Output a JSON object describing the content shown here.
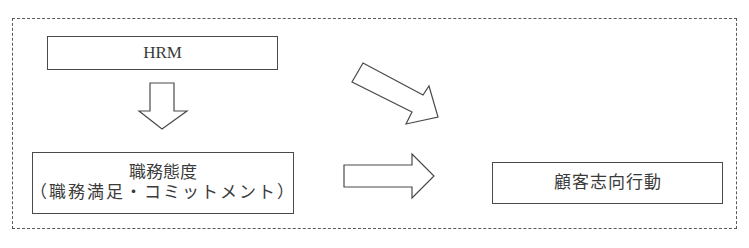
{
  "diagram": {
    "title": "",
    "frame": {
      "style": "dashed",
      "color": "#5a5a5a"
    },
    "nodes": [
      {
        "id": "hrm",
        "label": "HRM"
      },
      {
        "id": "attitude",
        "label": "職務態度",
        "sublabel": "（職務満足・コミットメント）"
      },
      {
        "id": "behavior",
        "label": "顧客志向行動"
      }
    ],
    "edges": [
      {
        "from": "hrm",
        "to": "attitude",
        "direction": "down",
        "style": "block-arrow-outline"
      },
      {
        "from": "hrm",
        "to": "behavior",
        "direction": "diagonal-down-right",
        "style": "block-arrow-outline"
      },
      {
        "from": "attitude",
        "to": "behavior",
        "direction": "right",
        "style": "block-arrow-outline"
      }
    ],
    "colors": {
      "stroke": "#4a4a4a",
      "text": "#3a3a3a",
      "background": "#ffffff"
    }
  }
}
